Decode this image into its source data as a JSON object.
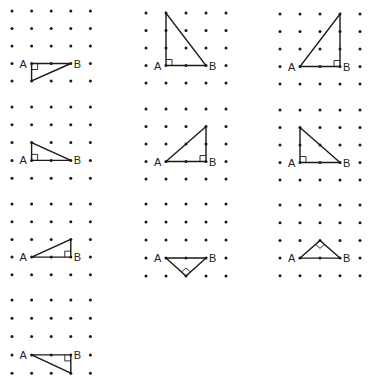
{
  "figure": {
    "grid": {
      "rows": 5,
      "cols": 5
    },
    "labels": {
      "a": "A",
      "b": "B"
    },
    "panels": [
      {
        "id": "p1",
        "origin": [
          12,
          11
        ],
        "dx": 19.6,
        "dy": 17.5,
        "a": [
          1,
          3
        ],
        "b": [
          3,
          3
        ],
        "c": [
          1,
          4
        ],
        "right_angle_at": "A"
      },
      {
        "id": "p2",
        "origin": [
          146,
          13
        ],
        "dx": 20.0,
        "dy": 17.5,
        "a": [
          1,
          3
        ],
        "b": [
          3,
          3
        ],
        "c": [
          1,
          0
        ],
        "right_angle_at": "A"
      },
      {
        "id": "p3",
        "origin": [
          280,
          14
        ],
        "dx": 20.0,
        "dy": 17.5,
        "a": [
          1,
          3
        ],
        "b": [
          3,
          3
        ],
        "c": [
          3,
          0
        ],
        "right_angle_at": "B"
      },
      {
        "id": "p4",
        "origin": [
          12,
          107
        ],
        "dx": 19.6,
        "dy": 17.8,
        "a": [
          1,
          3
        ],
        "b": [
          3,
          3
        ],
        "c": [
          1,
          2
        ],
        "right_angle_at": "A"
      },
      {
        "id": "p5",
        "origin": [
          146,
          109
        ],
        "dx": 20.0,
        "dy": 17.5,
        "a": [
          1,
          3
        ],
        "b": [
          3,
          3
        ],
        "c": [
          3,
          1
        ],
        "right_angle_at": "B"
      },
      {
        "id": "p6",
        "origin": [
          280,
          110
        ],
        "dx": 20.0,
        "dy": 17.5,
        "a": [
          1,
          3
        ],
        "b": [
          3,
          3
        ],
        "c": [
          1,
          1
        ],
        "right_angle_at": "A"
      },
      {
        "id": "p7",
        "origin": [
          12,
          204
        ],
        "dx": 19.6,
        "dy": 17.7,
        "a": [
          1,
          3
        ],
        "b": [
          3,
          3
        ],
        "c": [
          3,
          2
        ],
        "right_angle_at": "B"
      },
      {
        "id": "p8",
        "origin": [
          146,
          204
        ],
        "dx": 20.0,
        "dy": 18.0,
        "a": [
          1,
          3
        ],
        "b": [
          3,
          3
        ],
        "c": [
          2,
          4
        ],
        "right_angle_at": "C"
      },
      {
        "id": "p9",
        "origin": [
          280,
          205
        ],
        "dx": 20.0,
        "dy": 17.7,
        "a": [
          1,
          3
        ],
        "b": [
          3,
          3
        ],
        "c": [
          2,
          2
        ],
        "right_angle_at": "C"
      },
      {
        "id": "p10",
        "origin": [
          12,
          300
        ],
        "dx": 19.6,
        "dy": 18.3,
        "a": [
          1,
          3
        ],
        "b": [
          3,
          3
        ],
        "c": [
          3,
          4
        ],
        "right_angle_at": "B"
      }
    ]
  },
  "colors": {
    "ink": "#1a1a1a",
    "background": "#ffffff"
  }
}
